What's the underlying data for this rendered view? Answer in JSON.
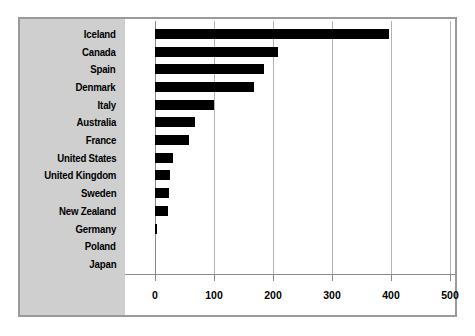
{
  "chart_data": {
    "type": "bar",
    "orientation": "horizontal",
    "title": "",
    "subtitle": "",
    "xlabel": "",
    "ylabel": "",
    "xlim": [
      0,
      500
    ],
    "xticks": [
      0,
      100,
      200,
      300,
      400,
      500
    ],
    "xtick_labels": [
      "0",
      "100",
      "200",
      "300",
      "400",
      "500"
    ],
    "grid": true,
    "legend": false,
    "legend_position": "none",
    "bar_color": "#000000",
    "panel_color": "#cfcfcf",
    "plot_background": "#ffffff",
    "gridline_color": "#b4b4b4",
    "border_color": "#9a9a9a",
    "categories": [
      "Iceland",
      "Canada",
      "Spain",
      "Denmark",
      "Italy",
      "Australia",
      "France",
      "United States",
      "United Kingdom",
      "Sweden",
      "New Zealand",
      "Germany",
      "Poland",
      "Japan"
    ],
    "values": [
      397,
      208,
      185,
      168,
      100,
      68,
      58,
      30,
      25,
      24,
      22,
      3,
      0,
      0
    ]
  }
}
